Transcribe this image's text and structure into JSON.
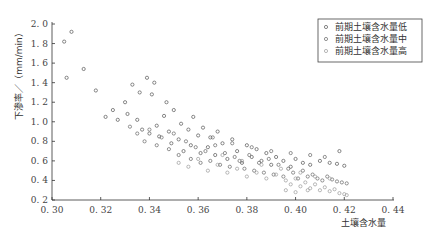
{
  "chart_data": {
    "type": "scatter",
    "title": "",
    "xlabel": "土壤含水量",
    "ylabel": "下渗率／（mm/min）",
    "xlim": [
      0.3,
      0.44
    ],
    "ylim": [
      0.2,
      2.0
    ],
    "xticks": [
      "0.30",
      "0.32",
      "0.34",
      "0.36",
      "0.38",
      "0.40",
      "0.42",
      "0.44"
    ],
    "yticks": [
      "0.2",
      "0.4",
      "0.6",
      "0.8",
      "1.0",
      "1.2",
      "1.4",
      "1.6",
      "1.8",
      "2.0"
    ],
    "grid": false,
    "legend_position": "upper right",
    "marker": "open circle",
    "series": [
      {
        "name": "前期土壤含水量低",
        "color": "#555555",
        "points": [
          [
            0.305,
            1.82
          ],
          [
            0.306,
            1.45
          ],
          [
            0.308,
            1.92
          ],
          [
            0.313,
            1.54
          ],
          [
            0.318,
            1.32
          ],
          [
            0.322,
            1.05
          ],
          [
            0.325,
            1.12
          ],
          [
            0.327,
            1.02
          ],
          [
            0.33,
            1.2
          ],
          [
            0.331,
            1.08
          ],
          [
            0.333,
            1.38
          ],
          [
            0.335,
            1.02
          ],
          [
            0.336,
            1.3
          ],
          [
            0.337,
            0.92
          ],
          [
            0.339,
            1.45
          ],
          [
            0.34,
            0.88
          ],
          [
            0.341,
            1.28
          ],
          [
            0.342,
            1.4
          ],
          [
            0.343,
            0.96
          ],
          [
            0.344,
            0.85
          ],
          [
            0.346,
            1.06
          ],
          [
            0.347,
            1.2
          ],
          [
            0.348,
            0.9
          ],
          [
            0.349,
            0.78
          ],
          [
            0.35,
            1.12
          ],
          [
            0.352,
            0.82
          ],
          [
            0.353,
            0.98
          ],
          [
            0.354,
            0.7
          ],
          [
            0.356,
            0.92
          ],
          [
            0.357,
            0.76
          ],
          [
            0.358,
            1.05
          ],
          [
            0.36,
            0.86
          ],
          [
            0.361,
            0.68
          ],
          [
            0.362,
            0.94
          ],
          [
            0.364,
            0.74
          ],
          [
            0.365,
            0.84
          ],
          [
            0.367,
            0.66
          ],
          [
            0.368,
            0.9
          ],
          [
            0.37,
            0.78
          ],
          [
            0.372,
            0.62
          ],
          [
            0.374,
            0.82
          ],
          [
            0.376,
            0.7
          ],
          [
            0.378,
            0.58
          ],
          [
            0.38,
            0.76
          ],
          [
            0.382,
            0.64
          ],
          [
            0.384,
            0.72
          ],
          [
            0.386,
            0.6
          ],
          [
            0.388,
            0.68
          ],
          [
            0.39,
            0.56
          ],
          [
            0.392,
            0.64
          ],
          [
            0.395,
            0.6
          ],
          [
            0.398,
            0.54
          ],
          [
            0.4,
            0.62
          ],
          [
            0.403,
            0.58
          ],
          [
            0.406,
            0.56
          ],
          [
            0.41,
            0.6
          ],
          [
            0.414,
            0.58
          ],
          [
            0.417,
            0.57
          ],
          [
            0.42,
            0.55
          ],
          [
            0.418,
            0.7
          ]
        ]
      },
      {
        "name": "前期土壤含水量中",
        "color": "#666666",
        "points": [
          [
            0.332,
            0.95
          ],
          [
            0.335,
            0.88
          ],
          [
            0.338,
            0.8
          ],
          [
            0.34,
            0.92
          ],
          [
            0.343,
            0.76
          ],
          [
            0.345,
            0.84
          ],
          [
            0.348,
            0.72
          ],
          [
            0.35,
            0.88
          ],
          [
            0.352,
            0.66
          ],
          [
            0.355,
            0.8
          ],
          [
            0.357,
            0.62
          ],
          [
            0.359,
            0.74
          ],
          [
            0.361,
            0.58
          ],
          [
            0.363,
            0.7
          ],
          [
            0.365,
            0.6
          ],
          [
            0.367,
            0.76
          ],
          [
            0.369,
            0.56
          ],
          [
            0.371,
            0.68
          ],
          [
            0.373,
            0.54
          ],
          [
            0.375,
            0.64
          ],
          [
            0.377,
            0.6
          ],
          [
            0.379,
            0.52
          ],
          [
            0.381,
            0.66
          ],
          [
            0.383,
            0.5
          ],
          [
            0.385,
            0.58
          ],
          [
            0.387,
            0.48
          ],
          [
            0.389,
            0.62
          ],
          [
            0.391,
            0.46
          ],
          [
            0.393,
            0.56
          ],
          [
            0.395,
            0.44
          ],
          [
            0.397,
            0.52
          ],
          [
            0.399,
            0.48
          ],
          [
            0.401,
            0.42
          ],
          [
            0.403,
            0.5
          ],
          [
            0.405,
            0.44
          ],
          [
            0.407,
            0.46
          ],
          [
            0.409,
            0.42
          ],
          [
            0.411,
            0.4
          ],
          [
            0.413,
            0.44
          ],
          [
            0.415,
            0.41
          ],
          [
            0.417,
            0.39
          ],
          [
            0.419,
            0.38
          ],
          [
            0.421,
            0.37
          ],
          [
            0.366,
            0.84
          ],
          [
            0.374,
            0.78
          ],
          [
            0.382,
            0.74
          ],
          [
            0.39,
            0.7
          ],
          [
            0.398,
            0.68
          ],
          [
            0.406,
            0.66
          ],
          [
            0.412,
            0.64
          ]
        ]
      },
      {
        "name": "前期土壤含水量高",
        "color": "#999999",
        "points": [
          [
            0.352,
            0.58
          ],
          [
            0.356,
            0.54
          ],
          [
            0.36,
            0.62
          ],
          [
            0.364,
            0.5
          ],
          [
            0.368,
            0.56
          ],
          [
            0.372,
            0.48
          ],
          [
            0.376,
            0.52
          ],
          [
            0.38,
            0.44
          ],
          [
            0.384,
            0.48
          ],
          [
            0.388,
            0.42
          ],
          [
            0.392,
            0.46
          ],
          [
            0.396,
            0.4
          ],
          [
            0.398,
            0.36
          ],
          [
            0.4,
            0.42
          ],
          [
            0.402,
            0.34
          ],
          [
            0.404,
            0.38
          ],
          [
            0.406,
            0.32
          ],
          [
            0.408,
            0.36
          ],
          [
            0.41,
            0.3
          ],
          [
            0.412,
            0.33
          ],
          [
            0.414,
            0.29
          ],
          [
            0.416,
            0.31
          ],
          [
            0.418,
            0.27
          ],
          [
            0.42,
            0.26
          ],
          [
            0.421,
            0.25
          ],
          [
            0.37,
            0.66
          ],
          [
            0.378,
            0.6
          ],
          [
            0.386,
            0.56
          ],
          [
            0.394,
            0.52
          ],
          [
            0.402,
            0.48
          ],
          [
            0.408,
            0.44
          ],
          [
            0.414,
            0.42
          ],
          [
            0.396,
            0.3
          ],
          [
            0.4,
            0.28
          ],
          [
            0.405,
            0.3
          ]
        ]
      }
    ]
  },
  "legend": {
    "items": [
      {
        "label": "前期土壤含水量低",
        "color": "#555555"
      },
      {
        "label": "前期土壤含水量中",
        "color": "#666666"
      },
      {
        "label": "前期土壤含水量高",
        "color": "#999999"
      }
    ]
  },
  "axes": {
    "xlabel": "土壤含水量",
    "ylabel": "下渗率／（mm/min）"
  }
}
